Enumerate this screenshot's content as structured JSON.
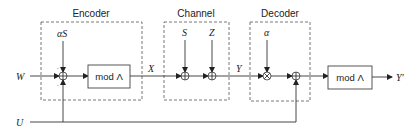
{
  "diagram": {
    "type": "block-diagram",
    "groups": {
      "encoder": {
        "label": "Encoder"
      },
      "channel": {
        "label": "Channel"
      },
      "decoder": {
        "label": "Decoder"
      }
    },
    "blocks": {
      "encoder_mod": {
        "label": "mod Λ"
      },
      "decoder_mod": {
        "label": "mod Λ"
      }
    },
    "signals": {
      "W": "W",
      "U": "U",
      "alphaS": "αS",
      "X": "X",
      "S": "S",
      "Z": "Z",
      "Y": "Y",
      "alpha": "α",
      "Yprime": "Y'"
    },
    "signs": {
      "enc_adder_top": "-",
      "enc_adder_bottom": "-"
    },
    "nodes": [
      {
        "id": "enc_adder",
        "op": "adder",
        "inputs": [
          "W",
          "αS",
          "U"
        ]
      },
      {
        "id": "ch_adder_s",
        "op": "adder",
        "inputs": [
          "X",
          "S"
        ]
      },
      {
        "id": "ch_adder_z",
        "op": "adder",
        "inputs": [
          "S-sum",
          "Z"
        ]
      },
      {
        "id": "dec_mult",
        "op": "multiplier",
        "inputs": [
          "Y",
          "α"
        ]
      },
      {
        "id": "dec_adder",
        "op": "adder",
        "inputs": [
          "αY",
          "U"
        ]
      }
    ]
  }
}
